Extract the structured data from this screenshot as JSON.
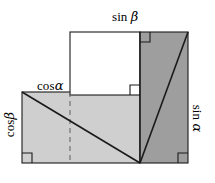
{
  "figure": {
    "name": "trigonometric-addition-identity-diagram",
    "background_color": "#ffffff",
    "stroke_color": "#1a1a1a",
    "colors": {
      "light_gray_fill": "#cfcfcf",
      "dark_gray_fill": "#9e9e9e",
      "white_fill": "#ffffff",
      "outline": "#1a1a1a",
      "dashed_line": "#6e6e6e"
    },
    "labels": {
      "sin_beta": {
        "text": "sin ",
        "symbol": "β",
        "rotation": 0
      },
      "cos_alpha": {
        "text": "cos",
        "symbol": "α",
        "rotation": 0
      },
      "cos_beta": {
        "text": "cos",
        "symbol": "β",
        "rotation": -90
      },
      "sin_alpha": {
        "text": "sin ",
        "symbol": "α",
        "rotation": 90
      }
    },
    "shapes": {
      "light_rectangle": {
        "x": 22,
        "y": 92,
        "width": 118,
        "height": 71,
        "fill": "#cfcfcf"
      },
      "white_rectangle": {
        "x": 70,
        "y": 32,
        "width": 70,
        "height": 63,
        "fill": "#ffffff"
      },
      "dark_rectangle": {
        "x": 140,
        "y": 32,
        "width": 48,
        "height": 131,
        "fill": "#9e9e9e"
      }
    },
    "lines": {
      "light_diagonal": {
        "x1": 22,
        "y1": 92,
        "x2": 140,
        "y2": 163
      },
      "dark_diagonal": {
        "x1": 188,
        "y1": 32,
        "x2": 140,
        "y2": 163
      },
      "dashed_vertical": {
        "x": 70,
        "y1": 92,
        "y2": 163
      }
    },
    "right_angle_markers": [
      {
        "name": "bottom-left",
        "x": 22,
        "y": 163,
        "corner": "bl"
      },
      {
        "name": "top-left-dark",
        "x": 140,
        "y": 32,
        "corner": "tl"
      },
      {
        "name": "junction-center",
        "x": 140,
        "y": 95,
        "corner": "br"
      },
      {
        "name": "bottom-right",
        "x": 188,
        "y": 163,
        "corner": "br"
      }
    ]
  }
}
